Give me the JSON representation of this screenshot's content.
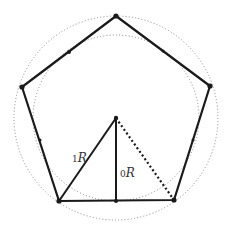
{
  "diagram": {
    "type": "geometry",
    "colors": {
      "stroke": "#1a1a1a",
      "circle": "#8a8a8a",
      "label": "#333333",
      "background": "#ffffff"
    },
    "center": [
      116,
      118
    ],
    "outer_circle_radius": 102,
    "inner_circle_radius": 83,
    "vertices": {
      "top": [
        116,
        16
      ],
      "right": [
        210,
        86
      ],
      "bottom_right": [
        174,
        200
      ],
      "bottom_left": [
        59,
        201
      ],
      "left": [
        22,
        87
      ]
    },
    "edge_midpoints": {
      "top_left": [
        69,
        52
      ],
      "top_right": [
        163,
        51
      ],
      "right": [
        192,
        143
      ],
      "left": [
        40,
        144
      ],
      "bottom": [
        116,
        201
      ]
    },
    "labels": {
      "r1_prefix": "1",
      "r1_letter": "R",
      "r0_prefix": "0",
      "r0_letter": "R"
    }
  }
}
